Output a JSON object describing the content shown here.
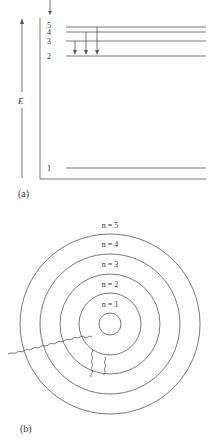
{
  "panel_a": {
    "label": "(a)",
    "axis_label": "E",
    "levels": [
      {
        "n": "5",
        "y": 27
      },
      {
        "n": "4",
        "y": 32
      },
      {
        "n": "3",
        "y": 41
      },
      {
        "n": "2",
        "y": 56
      },
      {
        "n": "1",
        "y": 168
      }
    ],
    "transitions": [
      {
        "from": "3",
        "to": "2"
      },
      {
        "from": "4",
        "to": "2"
      },
      {
        "from": "5",
        "to": "2"
      }
    ]
  },
  "panel_b": {
    "label": "(b)",
    "orbits": [
      {
        "label": "n = 1"
      },
      {
        "label": "n = 2"
      },
      {
        "label": "n = 3"
      },
      {
        "label": "n = 4"
      },
      {
        "label": "n = 5"
      }
    ]
  },
  "colors": {
    "line": "#555555",
    "text": "#333333"
  }
}
